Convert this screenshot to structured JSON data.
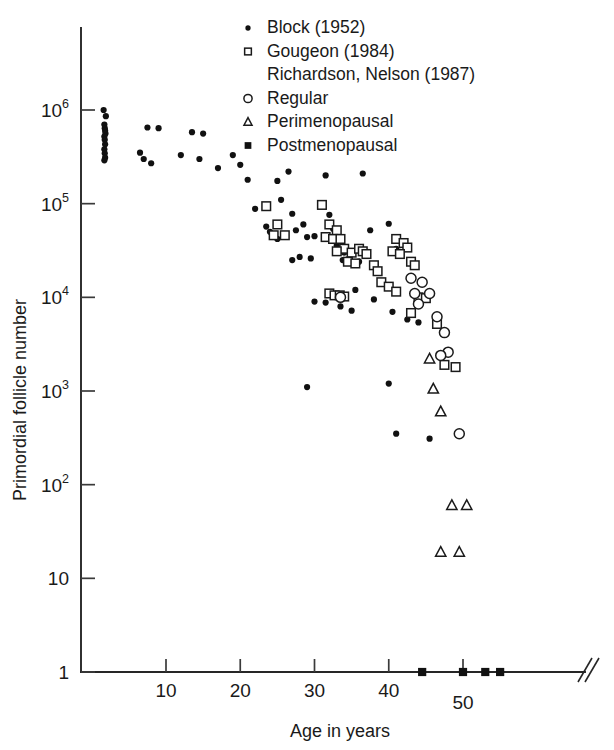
{
  "chart_data": {
    "type": "scatter",
    "title": "",
    "xlabel": "Age in years",
    "ylabel": "Primordial follicle number",
    "xlim": [
      0,
      58
    ],
    "ylim_log10": [
      0,
      6.35
    ],
    "grid": false,
    "log_y": true,
    "x_ticks": [
      10,
      20,
      30,
      40,
      50
    ],
    "x_tick_labels": [
      "10",
      "20",
      "30",
      "40",
      "50"
    ],
    "y_ticks_log10": [
      0,
      1,
      2,
      3,
      4,
      5,
      6
    ],
    "y_tick_labels": [
      "1",
      "10",
      "10",
      "10",
      "10",
      "10",
      "10"
    ],
    "y_tick_exponents": [
      "",
      "",
      "2",
      "3",
      "4",
      "5",
      "6"
    ],
    "axis_break": "//",
    "legend": {
      "position": "top-right",
      "entries": [
        {
          "marker": "filled-dot",
          "label": "Block (1952)"
        },
        {
          "marker": "open-square",
          "label": "Gougeon (1984)"
        },
        {
          "marker": "none",
          "label": "Richardson, Nelson (1987)"
        },
        {
          "marker": "open-circle",
          "label": "Regular"
        },
        {
          "marker": "open-triangle",
          "label": "Perimenopausal"
        },
        {
          "marker": "filled-square",
          "label": "Postmenopausal"
        }
      ]
    },
    "series": [
      {
        "name": "Block (1952)",
        "marker": "filled-dot",
        "points": [
          [
            1.6,
            1000000
          ],
          [
            1.9,
            860000
          ],
          [
            1.7,
            700000
          ],
          [
            1.75,
            640000
          ],
          [
            1.8,
            600000
          ],
          [
            1.85,
            560000
          ],
          [
            1.7,
            520000
          ],
          [
            1.75,
            480000
          ],
          [
            1.8,
            430000
          ],
          [
            1.7,
            380000
          ],
          [
            1.75,
            345000
          ],
          [
            1.8,
            310000
          ],
          [
            1.7,
            290000
          ],
          [
            7.5,
            650000
          ],
          [
            9.0,
            640000
          ],
          [
            6.5,
            350000
          ],
          [
            7.0,
            300000
          ],
          [
            8.0,
            270000
          ],
          [
            13.5,
            580000
          ],
          [
            15.0,
            560000
          ],
          [
            12.0,
            330000
          ],
          [
            14.5,
            300000
          ],
          [
            17.0,
            240000
          ],
          [
            19.0,
            330000
          ],
          [
            20.0,
            260000
          ],
          [
            21.0,
            180000
          ],
          [
            22.0,
            88000
          ],
          [
            23.5,
            57000
          ],
          [
            24.0,
            50000
          ],
          [
            25.0,
            175000
          ],
          [
            26.5,
            220000
          ],
          [
            25.5,
            110000
          ],
          [
            27.0,
            78000
          ],
          [
            24.5,
            47000
          ],
          [
            25.0,
            42000
          ],
          [
            27.5,
            52000
          ],
          [
            28.5,
            60000
          ],
          [
            29.0,
            44000
          ],
          [
            30.0,
            45000
          ],
          [
            27.0,
            25000
          ],
          [
            28.0,
            27000
          ],
          [
            29.5,
            26000
          ],
          [
            31.5,
            200000
          ],
          [
            32.0,
            76000
          ],
          [
            32.5,
            54000
          ],
          [
            33.0,
            36000
          ],
          [
            33.2,
            32000
          ],
          [
            33.5,
            31000
          ],
          [
            34.0,
            30000
          ],
          [
            33.8,
            25000
          ],
          [
            34.5,
            25500
          ],
          [
            30.0,
            9000
          ],
          [
            31.5,
            8800
          ],
          [
            36.5,
            210000
          ],
          [
            37.5,
            52000
          ],
          [
            36.0,
            24000
          ],
          [
            35.5,
            12000
          ],
          [
            38.0,
            9500
          ],
          [
            35.0,
            7200
          ],
          [
            33.5,
            8000
          ],
          [
            29.0,
            1100
          ],
          [
            40.0,
            61000
          ],
          [
            41.0,
            33000
          ],
          [
            41.5,
            30500
          ],
          [
            40.5,
            7000
          ],
          [
            42.5,
            5800
          ],
          [
            44.0,
            5400
          ],
          [
            40.0,
            1200
          ],
          [
            41.0,
            350
          ],
          [
            45.5,
            310
          ]
        ]
      },
      {
        "name": "Gougeon (1984)",
        "marker": "open-square",
        "points": [
          [
            23.5,
            94000
          ],
          [
            25.0,
            60000
          ],
          [
            24.5,
            46000
          ],
          [
            26.0,
            46000
          ],
          [
            31.0,
            97000
          ],
          [
            32.0,
            60000
          ],
          [
            33.0,
            52000
          ],
          [
            31.5,
            44000
          ],
          [
            32.5,
            42000
          ],
          [
            33.5,
            42000
          ],
          [
            34.0,
            33000
          ],
          [
            33.0,
            31000
          ],
          [
            35.0,
            30000
          ],
          [
            36.0,
            33000
          ],
          [
            36.5,
            31000
          ],
          [
            37.0,
            29000
          ],
          [
            34.5,
            24000
          ],
          [
            35.5,
            23000
          ],
          [
            32.0,
            11000
          ],
          [
            32.7,
            10500
          ],
          [
            33.4,
            10500
          ],
          [
            34.0,
            10200
          ],
          [
            38.0,
            22000
          ],
          [
            38.5,
            19000
          ],
          [
            39.0,
            14500
          ],
          [
            41.0,
            42000
          ],
          [
            42.0,
            38000
          ],
          [
            42.5,
            34000
          ],
          [
            40.5,
            31000
          ],
          [
            41.5,
            29000
          ],
          [
            43.0,
            24000
          ],
          [
            43.5,
            22000
          ],
          [
            40.0,
            13000
          ],
          [
            41.0,
            11500
          ],
          [
            44.0,
            10000
          ],
          [
            45.0,
            9800
          ],
          [
            43.0,
            6800
          ],
          [
            46.5,
            5200
          ],
          [
            47.5,
            1900
          ],
          [
            49.0,
            1800
          ]
        ]
      },
      {
        "name": "Richardson, Nelson (1987) — Regular",
        "marker": "open-circle",
        "points": [
          [
            33.5,
            10000
          ],
          [
            43.0,
            16000
          ],
          [
            44.5,
            14500
          ],
          [
            43.5,
            11000
          ],
          [
            45.5,
            11000
          ],
          [
            44.0,
            8500
          ],
          [
            46.5,
            6200
          ],
          [
            47.5,
            4200
          ],
          [
            48.0,
            2600
          ],
          [
            47.0,
            2400
          ],
          [
            49.5,
            350
          ]
        ]
      },
      {
        "name": "Richardson, Nelson (1987) — Perimenopausal",
        "marker": "open-triangle",
        "points": [
          [
            45.5,
            2200
          ],
          [
            46.0,
            1050
          ],
          [
            47.0,
            600
          ],
          [
            48.5,
            60
          ],
          [
            50.5,
            60
          ],
          [
            47.0,
            19
          ],
          [
            49.5,
            19
          ]
        ]
      },
      {
        "name": "Richardson, Nelson (1987) — Postmenopausal",
        "marker": "filled-square",
        "points": [
          [
            44.5,
            1
          ],
          [
            50.0,
            1
          ],
          [
            53.0,
            1
          ],
          [
            55.0,
            1
          ]
        ]
      }
    ]
  }
}
